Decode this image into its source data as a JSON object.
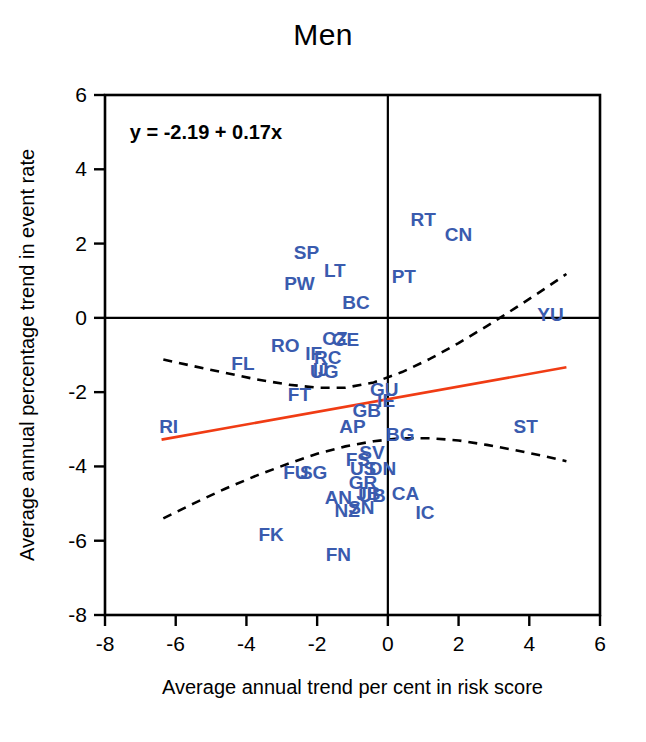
{
  "chart_data": {
    "type": "scatter",
    "title": "Men",
    "xlabel": "Average annual trend per cent in risk score",
    "ylabel": "Average annual percentage trend in event rate",
    "xlim": [
      -8,
      6
    ],
    "ylim": [
      -8,
      6
    ],
    "xticks": [
      -8,
      -6,
      -4,
      -2,
      0,
      2,
      4,
      6
    ],
    "yticks": [
      -8,
      -6,
      -4,
      -2,
      0,
      2,
      4,
      6
    ],
    "xtick_labels": [
      "-8",
      "-6",
      "-4",
      "-2",
      "0",
      "2",
      "4",
      "6"
    ],
    "ytick_labels": [
      "-8",
      "-6",
      "-4",
      "-2",
      "0",
      "2",
      "4",
      "6"
    ],
    "grid": false,
    "legend": null,
    "annotation": "y = -2.19 + 0.17x",
    "annotation_x": -7.3,
    "annotation_y": 5.0,
    "reference_lines": {
      "x": 0,
      "y": 0,
      "color": "#000000"
    },
    "point_color": "#3A5BAE",
    "fit_line": {
      "color": "#F03C14",
      "intercept": -2.19,
      "slope": 0.17,
      "x_start": -6.4,
      "x_end": 5.05
    },
    "confidence_band": {
      "color": "#000000",
      "style": "dashed",
      "upper": [
        [
          -6.35,
          -1.12
        ],
        [
          -5.5,
          -1.3
        ],
        [
          -4.6,
          -1.48
        ],
        [
          -3.7,
          -1.66
        ],
        [
          -2.8,
          -1.8
        ],
        [
          -2.0,
          -1.88
        ],
        [
          -1.2,
          -1.88
        ],
        [
          -0.4,
          -1.74
        ],
        [
          0.4,
          -1.46
        ],
        [
          1.2,
          -1.1
        ],
        [
          2.0,
          -0.68
        ],
        [
          2.8,
          -0.22
        ],
        [
          3.6,
          0.26
        ],
        [
          4.4,
          0.76
        ],
        [
          5.05,
          1.18
        ]
      ],
      "lower": [
        [
          -6.35,
          -5.4
        ],
        [
          -5.5,
          -5.0
        ],
        [
          -4.6,
          -4.6
        ],
        [
          -3.7,
          -4.24
        ],
        [
          -2.8,
          -3.92
        ],
        [
          -2.0,
          -3.66
        ],
        [
          -1.2,
          -3.46
        ],
        [
          -0.4,
          -3.32
        ],
        [
          0.4,
          -3.24
        ],
        [
          1.2,
          -3.24
        ],
        [
          2.0,
          -3.3
        ],
        [
          2.8,
          -3.42
        ],
        [
          3.6,
          -3.56
        ],
        [
          4.4,
          -3.72
        ],
        [
          5.05,
          -3.86
        ]
      ]
    },
    "points": [
      {
        "label": "RT",
        "x": 1.0,
        "y": 2.65
      },
      {
        "label": "CN",
        "x": 2.0,
        "y": 2.25
      },
      {
        "label": "SP",
        "x": -2.3,
        "y": 1.78
      },
      {
        "label": "LT",
        "x": -1.5,
        "y": 1.3
      },
      {
        "label": "PT",
        "x": 0.45,
        "y": 1.12
      },
      {
        "label": "PW",
        "x": -2.5,
        "y": 0.95
      },
      {
        "label": "BC",
        "x": -0.9,
        "y": 0.42
      },
      {
        "label": "YU",
        "x": 4.6,
        "y": 0.1
      },
      {
        "label": "CZ",
        "x": -1.5,
        "y": -0.55
      },
      {
        "label": "GE",
        "x": -1.2,
        "y": -0.58
      },
      {
        "label": "RO",
        "x": -2.9,
        "y": -0.72
      },
      {
        "label": "IF",
        "x": -2.1,
        "y": -0.95
      },
      {
        "label": "RC",
        "x": -1.7,
        "y": -1.05
      },
      {
        "label": "FL",
        "x": -4.1,
        "y": -1.22
      },
      {
        "label": "IJ",
        "x": -1.9,
        "y": -1.38
      },
      {
        "label": "UG",
        "x": -1.8,
        "y": -1.42
      },
      {
        "label": "GU",
        "x": -0.1,
        "y": -1.92
      },
      {
        "label": "FT",
        "x": -2.5,
        "y": -2.06
      },
      {
        "label": "IE",
        "x": -0.05,
        "y": -2.22
      },
      {
        "label": "GB",
        "x": -0.6,
        "y": -2.48
      },
      {
        "label": "RI",
        "x": -6.2,
        "y": -2.92
      },
      {
        "label": "AP",
        "x": -1.0,
        "y": -2.9
      },
      {
        "label": "BG",
        "x": 0.35,
        "y": -3.12
      },
      {
        "label": "ST",
        "x": 3.9,
        "y": -2.92
      },
      {
        "label": "SV",
        "x": -0.45,
        "y": -3.62
      },
      {
        "label": "FS",
        "x": -0.85,
        "y": -3.8
      },
      {
        "label": "US",
        "x": -0.7,
        "y": -4.05
      },
      {
        "label": "DN",
        "x": -0.15,
        "y": -4.05
      },
      {
        "label": "FU",
        "x": -2.6,
        "y": -4.15
      },
      {
        "label": "SG",
        "x": -2.1,
        "y": -4.15
      },
      {
        "label": "GR",
        "x": -0.7,
        "y": -4.42
      },
      {
        "label": "JB",
        "x": -0.55,
        "y": -4.72
      },
      {
        "label": "UB",
        "x": -0.45,
        "y": -4.76
      },
      {
        "label": "CA",
        "x": 0.5,
        "y": -4.72
      },
      {
        "label": "AN",
        "x": -1.4,
        "y": -4.82
      },
      {
        "label": "SN",
        "x": -0.75,
        "y": -5.08
      },
      {
        "label": "NZ",
        "x": -1.15,
        "y": -5.18
      },
      {
        "label": "IC",
        "x": 1.05,
        "y": -5.22
      },
      {
        "label": "FK",
        "x": -3.3,
        "y": -5.82
      },
      {
        "label": "FN",
        "x": -1.4,
        "y": -6.35
      }
    ]
  }
}
